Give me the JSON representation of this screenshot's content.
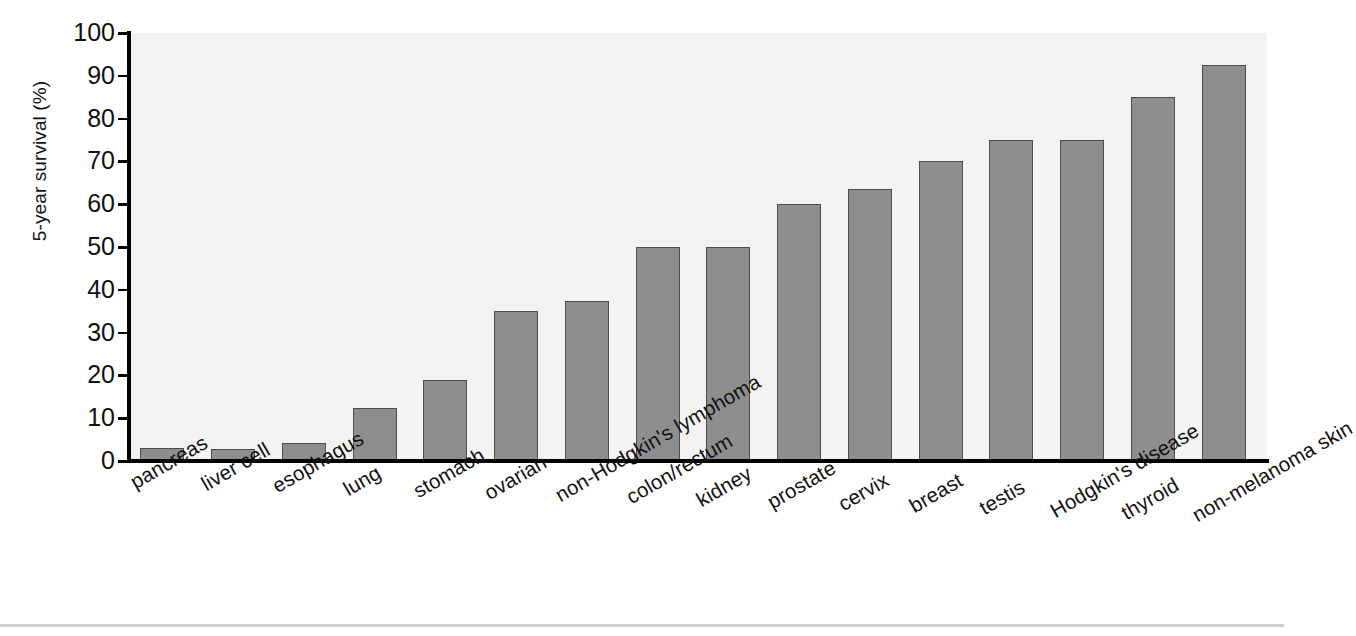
{
  "chart_data": {
    "type": "bar",
    "title": "",
    "xlabel": "",
    "ylabel": "5-year survival (%)",
    "ylim": [
      0,
      100
    ],
    "ytick_labels": [
      "0",
      "10",
      "20",
      "30",
      "40",
      "50",
      "60",
      "70",
      "80",
      "90",
      "100"
    ],
    "ytick_values": [
      0,
      10,
      20,
      30,
      40,
      50,
      60,
      70,
      80,
      90,
      100
    ],
    "grid": false,
    "legend": "none",
    "bar_color": "#8e8e8e",
    "bar_edge_color": "#4d4d4d",
    "plot_background": "#f3f3f1",
    "categories": [
      "pancreas",
      "liver cell",
      "esophagus",
      "lung",
      "stomach",
      "ovarian",
      "non-Hodgkin's lymphoma",
      "colon/rectum",
      "kidney",
      "prostate",
      "cervix",
      "breast",
      "testis",
      "Hodgkin's disease",
      "thyroid",
      "non-melanoma skin"
    ],
    "values": [
      3,
      2.8,
      4.2,
      12.3,
      19,
      35,
      37.5,
      50,
      50,
      60,
      63.5,
      70,
      75,
      75,
      85,
      92.5
    ]
  }
}
